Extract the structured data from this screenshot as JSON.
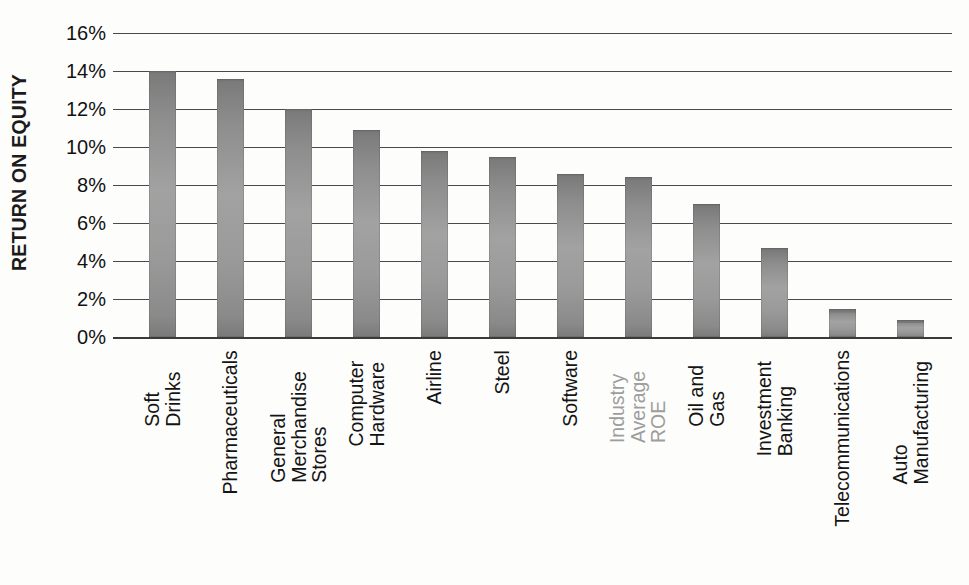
{
  "chart_data": {
    "type": "bar",
    "title": "",
    "xlabel": "",
    "ylabel": "RETURN ON EQUITY",
    "ylim": [
      0,
      16
    ],
    "ytick_step": 2,
    "ytick_labels": [
      "16%",
      "14%",
      "12%",
      "10%",
      "8%",
      "6%",
      "4%",
      "2%",
      "0%"
    ],
    "ytick_values": [
      16,
      14,
      12,
      10,
      8,
      6,
      4,
      2,
      0
    ],
    "grid": true,
    "legend": "none",
    "orientation": "vertical",
    "value_unit": "percent",
    "categories": [
      "Soft Drinks",
      "Pharmaceuticals",
      "General Merchandise Stores",
      "Computer Hardware",
      "Airline",
      "Steel",
      "Software",
      "Industry Average ROE",
      "Oil and Gas",
      "Investment Banking",
      "Telecommunications",
      "Auto Manufacturing"
    ],
    "values": [
      14.0,
      13.6,
      12.0,
      10.9,
      9.8,
      9.5,
      8.6,
      8.4,
      7.0,
      4.7,
      1.5,
      0.9
    ],
    "highlight_category": "Industry Average ROE",
    "highlight_color": "#9d9d9d",
    "bar_color": "#9a9a9a",
    "axis_color": "#4a4a4a",
    "background_color": "#fdfdfc"
  },
  "axis": {
    "y_title": "RETURN ON EQUITY"
  },
  "x_label_lines": [
    [
      "Soft Drinks"
    ],
    [
      "Pharmaceuticals"
    ],
    [
      "General",
      "Merchandise",
      "Stores"
    ],
    [
      "Computer",
      "Hardware"
    ],
    [
      "Airline"
    ],
    [
      "Steel"
    ],
    [
      "Software"
    ],
    [
      "Industry Average ROE"
    ],
    [
      "Oil and Gas"
    ],
    [
      "Investment Banking"
    ],
    [
      "Telecommunications"
    ],
    [
      "Auto Manufacturing"
    ]
  ]
}
